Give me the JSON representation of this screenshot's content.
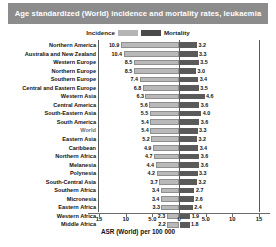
{
  "header": {
    "title": "Age standardized (World) incidence and mortality rates, leukaemia",
    "band_color": "#8c8c8c"
  },
  "legend": {
    "incidence_label": "Incidence",
    "mortality_label": "Mortality",
    "incidence_color": "#b9b9b9",
    "mortality_color": "#5a5a5a",
    "position": "top-center"
  },
  "axis": {
    "title": "ASR (World) per 100 000",
    "ticks": [
      "15",
      "10",
      "5.0",
      "0",
      "5.0",
      "10",
      "15"
    ],
    "max": 15,
    "grid": false
  },
  "chart_data": {
    "type": "bar",
    "title": "Age standardized (World) incidence and mortality rates, leukaemia",
    "subtitle": "",
    "xlabel": "ASR (World) per 100 000",
    "ylabel": "",
    "orientation": "horizontal-diverging",
    "xlim": [
      -15,
      15
    ],
    "tick_labels": [
      "15",
      "10",
      "5.0",
      "0",
      "5.0",
      "10",
      "15"
    ],
    "legend": [
      "Incidence",
      "Mortality"
    ],
    "categories": [
      "Northern America",
      "Australia and New Zealand",
      "Western Europe",
      "Northern Europe",
      "Southern Europe",
      "Central and Eastern Europe",
      "Western Asia",
      "Central America",
      "South-Eastern Asia",
      "South America",
      "World",
      "Eastern Asia",
      "Caribbean",
      "Northern Africa",
      "Melanesia",
      "Polynesia",
      "South-Central Asia",
      "Southern Africa",
      "Micronesia",
      "Eastern Africa",
      "Western Africa",
      "Middle Africa"
    ],
    "series": [
      {
        "name": "Incidence",
        "side": "left",
        "values": [
          10.9,
          10.4,
          8.5,
          8.5,
          7.4,
          6.8,
          6.3,
          5.6,
          5.5,
          5.4,
          5.4,
          5.2,
          4.9,
          4.7,
          4.4,
          4.2,
          3.7,
          3.4,
          3.4,
          3.3,
          2.3,
          2.2
        ]
      },
      {
        "name": "Mortality",
        "side": "right",
        "values": [
          3.2,
          3.3,
          3.5,
          3.0,
          3.4,
          3.5,
          4.6,
          3.6,
          4.0,
          3.6,
          3.3,
          3.2,
          3.4,
          3.6,
          3.6,
          3.3,
          3.2,
          2.7,
          2.6,
          2.4,
          1.9,
          1.8
        ]
      }
    ]
  }
}
